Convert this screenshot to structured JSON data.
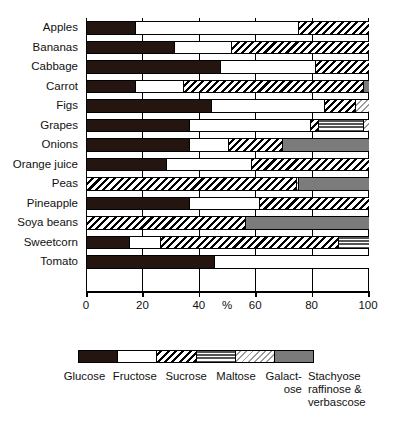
{
  "chart_data": {
    "type": "bar",
    "title": "",
    "xlabel": "%",
    "ylabel": "",
    "orientation": "horizontal",
    "stacked": true,
    "normalized_percent": true,
    "xlim": [
      0,
      100
    ],
    "xticks": [
      0,
      20,
      40,
      60,
      80,
      100
    ],
    "xtick_labels": [
      "0",
      "20",
      "40",
      "60",
      "80",
      "100"
    ],
    "grid": true,
    "legend_position": "bottom",
    "categories": [
      "Apples",
      "Bananas",
      "Cabbage",
      "Carrot",
      "Figs",
      "Grapes",
      "Onions",
      "Orange juice",
      "Peas",
      "Pineapple",
      "Soya beans",
      "Sweetcorn",
      "Tomato"
    ],
    "series": [
      {
        "name": "Glucose",
        "fill": "solid-black",
        "color": "#241510",
        "values": [
          17,
          31,
          47,
          17,
          44,
          36,
          36,
          28,
          0,
          36,
          0,
          15,
          45
        ]
      },
      {
        "name": "Fructose",
        "fill": "solid-white",
        "color": "#ffffff",
        "values": [
          58,
          20,
          34,
          17,
          40,
          43,
          14,
          30,
          0,
          25,
          0,
          11,
          55
        ]
      },
      {
        "name": "Sucrose",
        "fill": "diagonal-hatch-black",
        "color": "#000000",
        "values": [
          25,
          49,
          19,
          64,
          11,
          3,
          19,
          42,
          74,
          39,
          56,
          63,
          0
        ]
      },
      {
        "name": "Maltose",
        "fill": "horizontal-lines",
        "color": "#555555",
        "values": [
          0,
          0,
          0,
          0,
          0,
          16,
          0,
          0,
          0,
          0,
          0,
          11,
          0
        ]
      },
      {
        "name": "Galactose",
        "fill": "diagonal-hatch-light",
        "color": "#9a9a9a",
        "values": [
          0,
          0,
          0,
          0,
          5,
          2,
          0,
          0,
          1,
          0,
          0,
          0,
          0
        ]
      },
      {
        "name": "Stachyose raffinose & verbascose",
        "fill": "solid-grey",
        "color": "#7b7b7b",
        "values": [
          0,
          0,
          0,
          2,
          0,
          0,
          31,
          0,
          25,
          0,
          44,
          0,
          0
        ]
      }
    ],
    "legend_entries": [
      "Glucose",
      "Fructose",
      "Sucrose",
      "Maltose",
      "Galact-",
      "ose",
      "Stachyose",
      "raffinose &",
      "verbascose"
    ]
  },
  "axis": {
    "x_title": "%",
    "tick_0": "0",
    "tick_20": "20",
    "tick_40": "40",
    "tick_60": "60",
    "tick_80": "80",
    "tick_100": "100"
  },
  "legend": {
    "glucose": "Glucose",
    "fructose": "Fructose",
    "sucrose": "Sucrose",
    "maltose": "Maltose",
    "galactose_line1": "Galact-",
    "galactose_line2": "ose",
    "stachyose_line1": "Stachyose",
    "stachyose_line2": "raffinose &",
    "stachyose_line3": "verbascose"
  }
}
